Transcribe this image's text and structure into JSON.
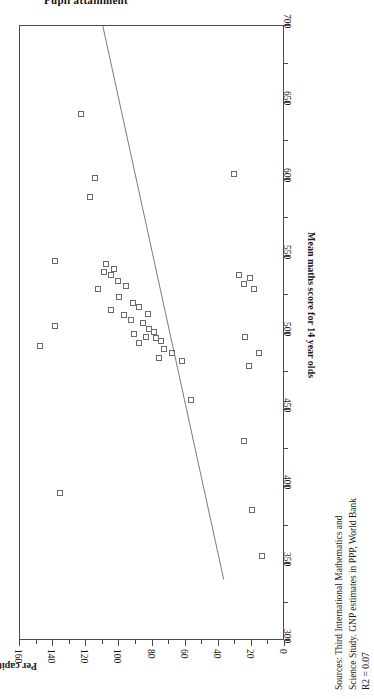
{
  "page": {
    "clipped_heading": "Pupil attainment",
    "orientation_note": "chart rotated 90 degrees on page"
  },
  "sources": {
    "line1": "Sources: Third International Mathematics and",
    "line2": "Science Study.  GNP estimates in PPP, World Bank",
    "line3": "R2 = 0.07"
  },
  "chart_data": {
    "type": "scatter",
    "title": "",
    "xlabel": "Mean maths score for 14 year olds",
    "ylabel": "Per capita GNP in 1994 relative to UK = 100",
    "xlim": [
      300,
      700
    ],
    "ylim": [
      0,
      160
    ],
    "xticks": [
      300,
      350,
      400,
      450,
      500,
      550,
      600,
      650,
      700
    ],
    "yticks": [
      0,
      20,
      40,
      60,
      80,
      100,
      120,
      140,
      160
    ],
    "xtick_labels": [
      "300",
      "350",
      "400",
      "450",
      "500",
      "550",
      "600",
      "650",
      "700"
    ],
    "ytick_labels": [
      "0",
      "20",
      "40",
      "60",
      "80",
      "100",
      "120",
      "140",
      "160"
    ],
    "grid": false,
    "legend": null,
    "marker": "open-square",
    "r_squared": 0.07,
    "points": [
      {
        "x": 643,
        "y": 123
      },
      {
        "x": 601,
        "y": 115
      },
      {
        "x": 589,
        "y": 118
      },
      {
        "x": 547,
        "y": 139
      },
      {
        "x": 545,
        "y": 108
      },
      {
        "x": 542,
        "y": 103
      },
      {
        "x": 540,
        "y": 109
      },
      {
        "x": 538,
        "y": 105
      },
      {
        "x": 534,
        "y": 101
      },
      {
        "x": 531,
        "y": 96
      },
      {
        "x": 529,
        "y": 113
      },
      {
        "x": 524,
        "y": 100
      },
      {
        "x": 520,
        "y": 92
      },
      {
        "x": 517,
        "y": 88
      },
      {
        "x": 515,
        "y": 105
      },
      {
        "x": 513,
        "y": 83
      },
      {
        "x": 512,
        "y": 97
      },
      {
        "x": 509,
        "y": 93
      },
      {
        "x": 507,
        "y": 86
      },
      {
        "x": 505,
        "y": 139
      },
      {
        "x": 503,
        "y": 82
      },
      {
        "x": 501,
        "y": 79
      },
      {
        "x": 500,
        "y": 91
      },
      {
        "x": 498,
        "y": 84
      },
      {
        "x": 497,
        "y": 78
      },
      {
        "x": 495,
        "y": 75
      },
      {
        "x": 494,
        "y": 88
      },
      {
        "x": 492,
        "y": 148
      },
      {
        "x": 490,
        "y": 73
      },
      {
        "x": 487,
        "y": 68
      },
      {
        "x": 484,
        "y": 76
      },
      {
        "x": 482,
        "y": 62
      },
      {
        "x": 538,
        "y": 28
      },
      {
        "x": 536,
        "y": 21
      },
      {
        "x": 532,
        "y": 25
      },
      {
        "x": 529,
        "y": 19
      },
      {
        "x": 604,
        "y": 31
      },
      {
        "x": 498,
        "y": 24
      },
      {
        "x": 487,
        "y": 16
      },
      {
        "x": 479,
        "y": 22
      },
      {
        "x": 457,
        "y": 57
      },
      {
        "x": 430,
        "y": 25
      },
      {
        "x": 396,
        "y": 136
      },
      {
        "x": 385,
        "y": 20
      },
      {
        "x": 355,
        "y": 14
      }
    ],
    "fit_line": {
      "x_start": 700,
      "y_start": 110,
      "x_end": 340,
      "y_end": 37,
      "slope_sign": "negative"
    }
  }
}
